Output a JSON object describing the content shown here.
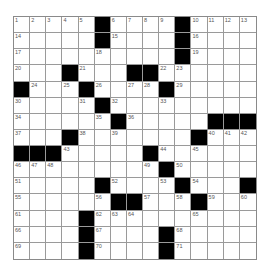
{
  "puzzle": {
    "rows": 15,
    "cols": 15,
    "colors": {
      "black": "#000000",
      "white": "#ffffff",
      "number": "#555555",
      "border": "#9a9a9a"
    },
    "grid": [
      [
        "1",
        "2",
        "3",
        "4",
        "5",
        "#",
        "6",
        "7",
        "8",
        "9",
        "#",
        "10",
        "11",
        "12",
        "13"
      ],
      [
        "14",
        "",
        "",
        "",
        "",
        "#",
        "15",
        "",
        "",
        "",
        "#",
        "16",
        "",
        "",
        ""
      ],
      [
        "17",
        "",
        "",
        "",
        "",
        "18",
        "",
        "",
        "",
        "",
        "#",
        "19",
        "",
        "",
        ""
      ],
      [
        "20",
        "",
        "",
        "#",
        "21",
        "",
        "",
        "#",
        "#",
        "22",
        "23",
        "",
        "",
        "",
        ""
      ],
      [
        "#",
        "24",
        "",
        "25",
        "#",
        "26",
        "",
        "27",
        "28",
        "#",
        "29",
        "",
        "",
        "",
        ""
      ],
      [
        "30",
        "",
        "",
        "",
        "31",
        "#",
        "32",
        "",
        "",
        "33",
        "",
        "",
        "",
        "",
        ""
      ],
      [
        "34",
        "",
        "",
        "",
        "",
        "35",
        "#",
        "36",
        "",
        "",
        "",
        "",
        "#",
        "#",
        "#"
      ],
      [
        "37",
        "",
        "",
        "#",
        "38",
        "",
        "39",
        "",
        "",
        "",
        "",
        "#",
        "40",
        "41",
        "42"
      ],
      [
        "#",
        "#",
        "#",
        "43",
        "",
        "",
        "",
        "",
        "#",
        "44",
        "",
        "45",
        "",
        "",
        ""
      ],
      [
        "46",
        "47",
        "48",
        "",
        "",
        "",
        "",
        "",
        "49",
        "#",
        "50",
        "",
        "",
        "",
        ""
      ],
      [
        "51",
        "",
        "",
        "",
        "",
        "#",
        "52",
        "",
        "",
        "53",
        "#",
        "54",
        "",
        "",
        "#"
      ],
      [
        "55",
        "",
        "",
        "",
        "",
        "56",
        "#",
        "#",
        "57",
        "",
        "58",
        "#",
        "59",
        "",
        "60"
      ],
      [
        "61",
        "",
        "",
        "",
        "#",
        "62",
        "63",
        "64",
        "",
        "",
        "",
        "65",
        "",
        "",
        ""
      ],
      [
        "66",
        "",
        "",
        "",
        "#",
        "67",
        "",
        "",
        "",
        "#",
        "68",
        "",
        "",
        "",
        ""
      ],
      [
        "69",
        "",
        "",
        "",
        "#",
        "70",
        "",
        "",
        "",
        "#",
        "71",
        "",
        "",
        "",
        ""
      ]
    ]
  }
}
